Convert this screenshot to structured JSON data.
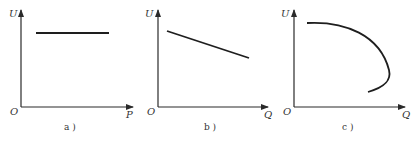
{
  "figure": {
    "panels": [
      {
        "id": "a",
        "caption": "a )",
        "y_label": "U",
        "x_label": "P",
        "origin_label": "O",
        "description": "Horizontal line: U constant with respect to P"
      },
      {
        "id": "b",
        "caption": "b )",
        "y_label": "U",
        "x_label": "Q",
        "origin_label": "O",
        "description": "Straight line decreasing: U falls linearly as Q increases"
      },
      {
        "id": "c",
        "caption": "c )",
        "y_label": "U",
        "x_label": "Q",
        "origin_label": "O",
        "description": "Curve: U decreases as Q increases, then Q folds back (nose curve)"
      }
    ]
  }
}
